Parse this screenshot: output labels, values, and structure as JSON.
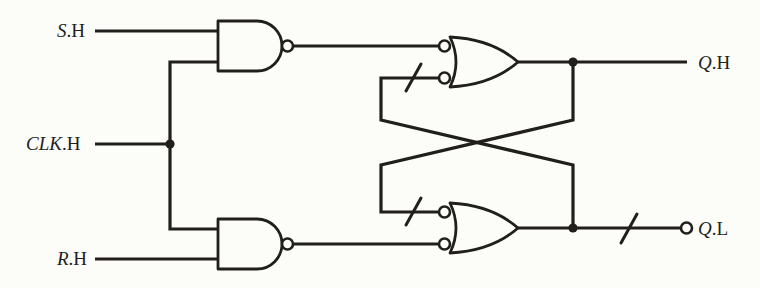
{
  "diagram": {
    "kind": "logic-schematic",
    "gate_count": 4,
    "components": {
      "gates": [
        {
          "id": "nand-gate-top",
          "shape": "nand",
          "output_bubble": true
        },
        {
          "id": "nand-gate-bottom",
          "shape": "nand",
          "output_bubble": true
        },
        {
          "id": "or-gate-top",
          "shape": "or",
          "inverted_inputs": 2
        },
        {
          "id": "or-gate-bottom",
          "shape": "or",
          "inverted_inputs": 2
        }
      ],
      "polarity_slashes": 3,
      "junction_dots": 3,
      "output_bubble_on": "Q.L"
    }
  },
  "labels": {
    "s": {
      "var": "S",
      "suffix": ".H"
    },
    "clk": {
      "var": "CLK",
      "suffix": ".H"
    },
    "r": {
      "var": "R",
      "suffix": ".H"
    },
    "qh": {
      "var": "Q",
      "suffix": ".H"
    },
    "ql": {
      "var": "Q",
      "suffix": ".L"
    }
  },
  "colors": {
    "ink": "#211f1c",
    "paper": "#fcfcf9"
  }
}
